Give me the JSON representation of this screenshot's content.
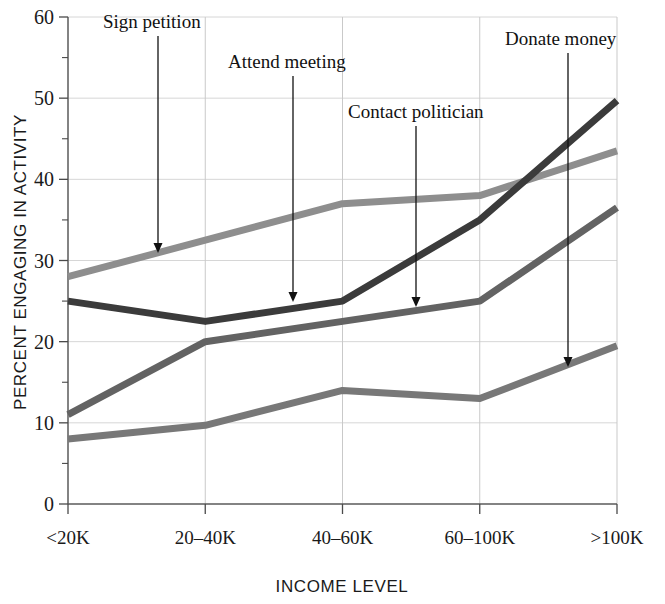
{
  "chart_data": {
    "type": "line",
    "title": "",
    "xlabel": "INCOME LEVEL",
    "ylabel": "PERCENT ENGAGING IN ACTIVITY",
    "categories": [
      "<20K",
      "20–40K",
      "40–60K",
      "60–100K",
      ">100K"
    ],
    "ylim": [
      0,
      60
    ],
    "ytick_values": [
      0,
      10,
      20,
      30,
      40,
      50,
      60
    ],
    "ytick_labels": [
      "0",
      "10",
      "20",
      "30",
      "40",
      "50",
      "60"
    ],
    "yminor_step": 5,
    "grid": "horizontal-and-vertical",
    "legend": "none-inline-annotations",
    "series": [
      {
        "name": "Sign petition",
        "color": "#8e8e8e",
        "values": [
          28,
          32.5,
          37,
          38,
          43.5
        ]
      },
      {
        "name": "Attend meeting",
        "color": "#3b3b3b",
        "values": [
          25,
          22.5,
          25,
          35,
          49.7
        ]
      },
      {
        "name": "Contact politician",
        "color": "#636363",
        "values": [
          11,
          20,
          22.5,
          25,
          36.5
        ]
      },
      {
        "name": "Donate money",
        "color": "#787878",
        "values": [
          8,
          9.7,
          14,
          13,
          19.5
        ]
      }
    ],
    "annotations": [
      {
        "label": "Sign petition",
        "label_x": 103,
        "label_y": 28,
        "arrow_x": 158,
        "arrow_top": 36,
        "arrow_bottom": 253
      },
      {
        "label": "Attend meeting",
        "label_x": 228,
        "label_y": 68,
        "arrow_x": 293,
        "arrow_top": 76,
        "arrow_bottom": 302
      },
      {
        "label": "Contact politician",
        "label_x": 348,
        "label_y": 118,
        "arrow_x": 416,
        "arrow_top": 126,
        "arrow_bottom": 307
      },
      {
        "label": "Donate money",
        "label_x": 505,
        "label_y": 45,
        "arrow_x": 568,
        "arrow_top": 53,
        "arrow_bottom": 367
      }
    ]
  }
}
